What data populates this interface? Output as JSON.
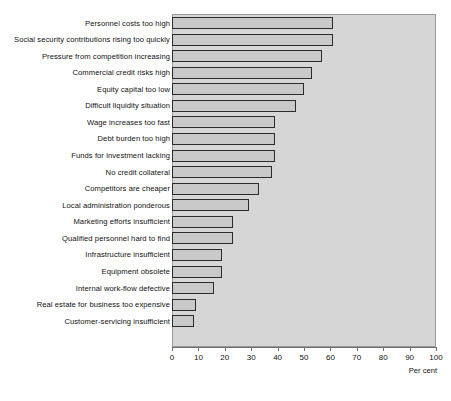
{
  "chart_data": {
    "type": "bar",
    "orientation": "horizontal",
    "title": "",
    "subtitle": "",
    "xlabel": "Per cent",
    "ylabel": "",
    "xlim": [
      0,
      100
    ],
    "xticks": [
      0,
      10,
      20,
      30,
      40,
      50,
      60,
      70,
      80,
      90,
      100
    ],
    "xtick_labels": [
      "0",
      "10",
      "20",
      "30",
      "40",
      "50",
      "60",
      "70",
      "80",
      "90",
      "100"
    ],
    "grid": false,
    "legend": null,
    "categories": [
      "Personnel costs too high",
      "Social security contributions rising too quickly",
      "Pressure from competition increasing",
      "Commercial credit risks high",
      "Equity capital too low",
      "Difficult liquidity situation",
      "Wage increases too fast",
      "Debt burden too high",
      "Funds for investment lacking",
      "No credit collateral",
      "Competitors are cheaper",
      "Local administration ponderous",
      "Marketing efforts insufficient",
      "Qualified personnel hard to find",
      "Infrastructure insufficient",
      "Equipment obsolete",
      "Internal work-flow defective",
      "Real estate for business too expensive",
      "Customer-servicing insufficient"
    ],
    "values": [
      61,
      61,
      57,
      53,
      50,
      47,
      39,
      39,
      39,
      38,
      33,
      29,
      23,
      23,
      19,
      19,
      16,
      9,
      8.5
    ],
    "colors": {
      "bar_fill": "#c9c9c9",
      "bar_border": "#2b2b2b",
      "plot_background": "#d6d6d6",
      "plot_border": "#9a9a9a",
      "axis": "#6f6f6f",
      "text": "#111111"
    }
  },
  "caption": {
    "text": ""
  }
}
